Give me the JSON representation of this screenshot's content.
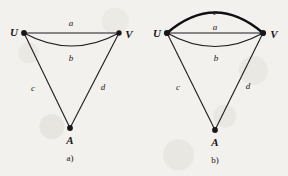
{
  "figure": {
    "background_color": "#f3f1ed",
    "ink_color": "#19171a"
  },
  "panels": [
    {
      "id": "a",
      "caption": "a)",
      "vertices": [
        {
          "name": "U",
          "label": "U"
        },
        {
          "name": "V",
          "label": "V"
        },
        {
          "name": "A",
          "label": "A"
        }
      ],
      "edges": [
        {
          "label": "a",
          "from": "U",
          "to": "V",
          "style": "straight",
          "weight": "thin"
        },
        {
          "label": "b",
          "from": "U",
          "to": "V",
          "style": "arc-below",
          "weight": "thin"
        },
        {
          "label": "c",
          "from": "U",
          "to": "A",
          "style": "straight",
          "weight": "thin"
        },
        {
          "label": "d",
          "from": "V",
          "to": "A",
          "style": "straight",
          "weight": "thin"
        }
      ]
    },
    {
      "id": "b",
      "caption": "b)",
      "vertices": [
        {
          "name": "U",
          "label": "U"
        },
        {
          "name": "V",
          "label": "V"
        },
        {
          "name": "A",
          "label": "A"
        }
      ],
      "edges": [
        {
          "label": "e",
          "from": "U",
          "to": "V",
          "style": "arc-above",
          "weight": "thick"
        },
        {
          "label": "a",
          "from": "U",
          "to": "V",
          "style": "straight",
          "weight": "thin"
        },
        {
          "label": "b",
          "from": "U",
          "to": "V",
          "style": "arc-below",
          "weight": "thin"
        },
        {
          "label": "c",
          "from": "U",
          "to": "A",
          "style": "straight",
          "weight": "thin"
        },
        {
          "label": "d",
          "from": "V",
          "to": "A",
          "style": "straight",
          "weight": "thin"
        }
      ]
    }
  ]
}
